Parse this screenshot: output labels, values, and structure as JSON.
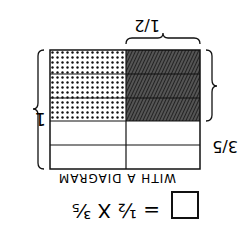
{
  "equation": {
    "left": "½ X ³⁄₅",
    "equals": "="
  },
  "caption": "WITH A DIAGRAM",
  "labels": {
    "whole": "1",
    "rows_fraction": "3/5",
    "cols_fraction": "1/2"
  },
  "grid": {
    "rows": 5,
    "cols": 2,
    "shaded_rows": 3,
    "left_pattern": "dots",
    "right_pattern": "hatch"
  }
}
